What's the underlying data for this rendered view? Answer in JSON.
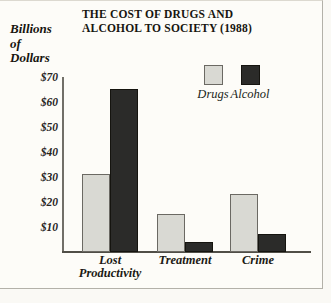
{
  "chart_data": {
    "type": "bar",
    "title": "THE COST OF DRUGS AND ALCOHOL TO SOCIETY (1988)",
    "title_lines": [
      "THE COST OF DRUGS AND",
      "ALCOHOL TO SOCIETY (1988)"
    ],
    "ylabel": "Billions of Dollars",
    "ylabel_lines": [
      "Billions",
      "of",
      "Dollars"
    ],
    "categories": [
      "Lost Productivity",
      "Treatment",
      "Crime"
    ],
    "categories_display": [
      [
        "Lost",
        "Productivity"
      ],
      [
        "Treatment"
      ],
      [
        "Crime"
      ]
    ],
    "series": [
      {
        "name": "Drugs",
        "values": [
          31,
          15,
          23
        ],
        "color": "#d9d9d3"
      },
      {
        "name": "Alcohol",
        "values": [
          65,
          4,
          7
        ],
        "color": "#2b2b29"
      }
    ],
    "y_ticks": [
      "$70",
      "$60",
      "$50",
      "$40",
      "$30",
      "$20",
      "$10"
    ],
    "y_tick_values": [
      70,
      60,
      50,
      40,
      30,
      20,
      10
    ],
    "ylim": [
      0,
      72
    ],
    "grid": false,
    "legend_position": "top-right"
  },
  "colors": {
    "drugs_bar": "#d9d9d3",
    "alcohol_bar": "#2b2b29",
    "axis": "#55534e",
    "frame_border": "#b3b1a9",
    "background": "#fdfcf8",
    "text": "#17150f"
  }
}
